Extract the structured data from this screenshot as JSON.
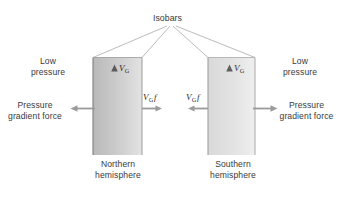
{
  "figure": {
    "title_label": "Isobars",
    "background_color": "#ffffff",
    "text_color": "#3a3a3a",
    "arrow_color": "#8c8c8c",
    "box_edge_color": "#8a8a8a",
    "leader_line_color": "#9a9a9a"
  },
  "labels": {
    "isobars": "Isobars",
    "low_pressure_left": "Low\npressure",
    "low_pressure_right": "Low\npressure",
    "pgf_left": "Pressure\ngradient force",
    "pgf_right": "Pressure\ngradient force",
    "northern": "Northern\nhemisphere",
    "southern": "Southern\nhemisphere"
  },
  "panels": [
    {
      "name": "northern-hemisphere",
      "caption": "Northern\nhemisphere",
      "wind_label_base": "V",
      "wind_label_sub": "G",
      "coriolis_label_base": "V",
      "coriolis_label_sub": "G",
      "coriolis_label_f": "f",
      "wind_direction": "up",
      "coriolis_direction": "right",
      "pgf_direction": "left"
    },
    {
      "name": "southern-hemisphere",
      "caption": "Southern\nhemisphere",
      "wind_label_base": "V",
      "wind_label_sub": "G",
      "coriolis_label_base": "V",
      "coriolis_label_sub": "G",
      "coriolis_label_f": "f",
      "wind_direction": "up",
      "coriolis_direction": "left",
      "pgf_direction": "right"
    }
  ],
  "symbols": {
    "vg": "V",
    "vg_sub": "G",
    "f": "f"
  }
}
